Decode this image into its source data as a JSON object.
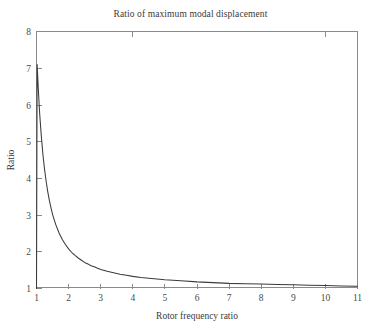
{
  "chart_data": {
    "type": "line",
    "title": "Ratio of maximum modal displacement",
    "xlabel": "Rotor frequency ratio",
    "ylabel": "Ratio",
    "xlim": [
      1,
      11
    ],
    "ylim": [
      1,
      8
    ],
    "grid": false,
    "legend": null,
    "x_ticks": [
      "1",
      "2",
      "3",
      "4",
      "5",
      "6",
      "7",
      "8",
      "9",
      "10",
      "11"
    ],
    "y_ticks": [
      "1",
      "2",
      "3",
      "4",
      "5",
      "6",
      "7",
      "8"
    ],
    "series": [
      {
        "name": "Ratio of maximum modal displacement",
        "color": "#3b3b3b",
        "x": [
          1.0,
          1.02,
          1.05,
          1.08,
          1.1,
          1.15,
          1.2,
          1.25,
          1.3,
          1.35,
          1.4,
          1.45,
          1.5,
          1.6,
          1.7,
          1.8,
          1.9,
          2.0,
          2.1,
          2.2,
          2.3,
          2.4,
          2.5,
          2.6,
          2.7,
          2.8,
          2.9,
          3.0,
          3.2,
          3.4,
          3.6,
          3.8,
          4.0,
          4.25,
          4.5,
          4.75,
          5.0,
          5.5,
          6.0,
          6.5,
          7.0,
          7.5,
          8.0,
          8.5,
          9.0,
          9.5,
          10.0,
          10.5,
          11.0
        ],
        "y": [
          1.0,
          7.1,
          6.55,
          6.05,
          5.75,
          5.15,
          4.65,
          4.25,
          3.92,
          3.64,
          3.4,
          3.2,
          3.02,
          2.74,
          2.52,
          2.34,
          2.2,
          2.08,
          1.98,
          1.9,
          1.83,
          1.77,
          1.71,
          1.67,
          1.62,
          1.59,
          1.55,
          1.52,
          1.47,
          1.43,
          1.39,
          1.36,
          1.33,
          1.3,
          1.28,
          1.26,
          1.24,
          1.21,
          1.18,
          1.16,
          1.14,
          1.13,
          1.12,
          1.11,
          1.1,
          1.09,
          1.08,
          1.07,
          1.06
        ]
      }
    ]
  },
  "axes": {
    "x_title": "Rotor frequency ratio",
    "y_title": "Ratio"
  }
}
